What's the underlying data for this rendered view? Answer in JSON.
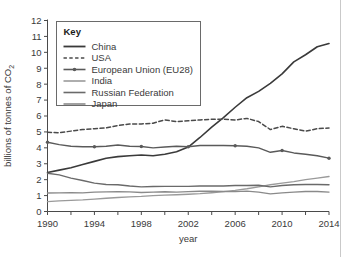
{
  "chart_data": {
    "type": "line",
    "title": "",
    "xlabel": "year",
    "ylabel": "billions of tonnes of CO2",
    "ylabel_display": "billions of tonnes of CO",
    "ylabel_subscript": "2",
    "xlim": [
      1990,
      2014
    ],
    "ylim": [
      0,
      12
    ],
    "ytick_step": 1,
    "xtick_labelled_step": 4,
    "xtick_minor_step": 2,
    "grid": false,
    "legend_position": "top-left-inside",
    "legend_title": "Key",
    "yticks": [
      "0",
      "1",
      "2",
      "3",
      "4",
      "5",
      "6",
      "7",
      "8",
      "9",
      "10",
      "11",
      "12"
    ],
    "xticks": [
      "1990",
      "1994",
      "1998",
      "2002",
      "2006",
      "2010",
      "2014"
    ],
    "x": [
      1990,
      1991,
      1992,
      1993,
      1994,
      1995,
      1996,
      1997,
      1998,
      1999,
      2000,
      2001,
      2002,
      2003,
      2004,
      2005,
      2006,
      2007,
      2008,
      2009,
      2010,
      2011,
      2012,
      2013,
      2014
    ],
    "series": [
      {
        "name": "China",
        "style": "solid",
        "color": "#3a3a3a",
        "width": 1.6,
        "markers": false,
        "values": [
          2.45,
          2.6,
          2.75,
          2.95,
          3.15,
          3.35,
          3.45,
          3.5,
          3.55,
          3.5,
          3.6,
          3.75,
          4.05,
          4.65,
          5.3,
          5.9,
          6.55,
          7.15,
          7.55,
          8.05,
          8.65,
          9.4,
          9.85,
          10.35,
          10.55
        ]
      },
      {
        "name": "USA",
        "style": "dashed",
        "color": "#4a4a4a",
        "width": 1.5,
        "markers": false,
        "values": [
          4.98,
          4.95,
          5.05,
          5.15,
          5.2,
          5.25,
          5.4,
          5.5,
          5.5,
          5.55,
          5.75,
          5.65,
          5.7,
          5.75,
          5.8,
          5.8,
          5.75,
          5.85,
          5.65,
          5.15,
          5.35,
          5.2,
          5.05,
          5.2,
          5.25
        ]
      },
      {
        "name": "European Union (EU28)",
        "style": "solid-marker",
        "color": "#5a5a5a",
        "width": 1.4,
        "markers": true,
        "marker_years": [
          1990,
          1994,
          1998,
          2002,
          2006,
          2010,
          2014
        ],
        "values": [
          4.35,
          4.2,
          4.1,
          4.07,
          4.07,
          4.1,
          4.18,
          4.1,
          4.08,
          4.0,
          4.05,
          4.1,
          4.07,
          4.15,
          4.15,
          4.15,
          4.13,
          4.1,
          4.0,
          3.72,
          3.83,
          3.68,
          3.6,
          3.5,
          3.35
        ]
      },
      {
        "name": "India",
        "style": "solid",
        "color": "#9a9a9a",
        "width": 1.4,
        "markers": false,
        "values": [
          0.62,
          0.67,
          0.7,
          0.73,
          0.78,
          0.83,
          0.88,
          0.92,
          0.95,
          1.0,
          1.03,
          1.05,
          1.08,
          1.12,
          1.18,
          1.25,
          1.33,
          1.43,
          1.55,
          1.68,
          1.78,
          1.88,
          2.0,
          2.1,
          2.2
        ]
      },
      {
        "name": "Russian Federation",
        "style": "solid",
        "color": "#6a6a6a",
        "width": 1.4,
        "markers": false,
        "values": [
          2.4,
          2.3,
          2.1,
          1.95,
          1.78,
          1.7,
          1.68,
          1.6,
          1.55,
          1.57,
          1.58,
          1.58,
          1.58,
          1.6,
          1.6,
          1.6,
          1.63,
          1.63,
          1.65,
          1.55,
          1.63,
          1.68,
          1.7,
          1.7,
          1.68
        ]
      },
      {
        "name": "Japan",
        "style": "solid",
        "color": "#8a8a8a",
        "width": 1.4,
        "markers": false,
        "values": [
          1.16,
          1.17,
          1.18,
          1.17,
          1.22,
          1.23,
          1.24,
          1.23,
          1.19,
          1.22,
          1.24,
          1.22,
          1.25,
          1.27,
          1.27,
          1.26,
          1.25,
          1.28,
          1.22,
          1.11,
          1.17,
          1.22,
          1.26,
          1.26,
          1.22
        ]
      }
    ]
  },
  "legend": {
    "title": "Key",
    "items": [
      {
        "label": "China"
      },
      {
        "label": "USA"
      },
      {
        "label": "European Union (EU28)"
      },
      {
        "label": "India"
      },
      {
        "label": "Russian Federation"
      },
      {
        "label": "Japan"
      }
    ]
  },
  "axes": {
    "x_title": "year",
    "y_title_main": "billions of tonnes of CO",
    "y_title_sub": "2"
  }
}
